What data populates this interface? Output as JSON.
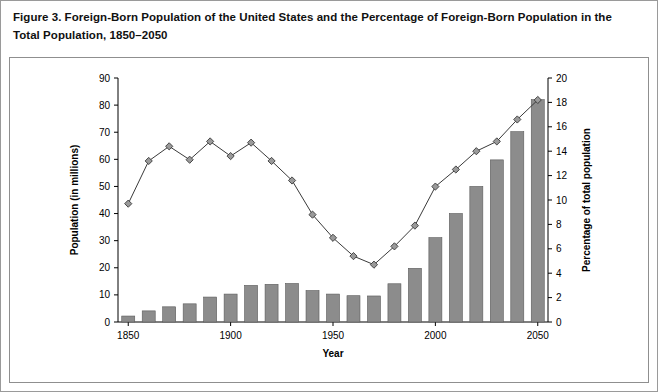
{
  "figure": {
    "title": "Figure 3. Foreign-Born Population of the United States and the Percentage of Foreign-Born Population in the Total Population, 1850–2050"
  },
  "chart_data": {
    "type": "bar",
    "title": "Figure 3. Foreign-Born Population of the United States and the Percentage of Foreign-Born Population in the Total Population, 1850–2050",
    "xlabel": "Year",
    "ylabel": "Population (in millions)",
    "y2label": "Percentage of total population",
    "xlim": [
      1845,
      2055
    ],
    "ylim": [
      0,
      90
    ],
    "y2lim": [
      0,
      20
    ],
    "grid": false,
    "legend": "none",
    "x_ticks": [
      1850,
      1900,
      1950,
      2000,
      2050
    ],
    "y_ticks": [
      0,
      10,
      20,
      30,
      40,
      50,
      60,
      70,
      80,
      90
    ],
    "y2_ticks": [
      0,
      2,
      4,
      6,
      8,
      10,
      12,
      14,
      16,
      18,
      20
    ],
    "categories": [
      1850,
      1860,
      1870,
      1880,
      1890,
      1900,
      1910,
      1920,
      1930,
      1940,
      1950,
      1960,
      1970,
      1980,
      1990,
      2000,
      2010,
      2020,
      2030,
      2040,
      2050
    ],
    "series": [
      {
        "name": "Population (in millions)",
        "type": "bar",
        "axis": "left",
        "values": [
          2.2,
          4.1,
          5.6,
          6.7,
          9.2,
          10.3,
          13.5,
          13.9,
          14.2,
          11.6,
          10.3,
          9.7,
          9.6,
          14.1,
          19.8,
          31.1,
          40.0,
          50.0,
          59.8,
          70.2,
          82.0
        ]
      },
      {
        "name": "Percentage of total population",
        "type": "line",
        "axis": "right",
        "values": [
          9.7,
          13.2,
          14.4,
          13.3,
          14.8,
          13.6,
          14.7,
          13.2,
          11.6,
          8.8,
          6.9,
          5.4,
          4.7,
          6.2,
          7.9,
          11.1,
          12.5,
          14.0,
          14.8,
          16.6,
          18.2
        ]
      }
    ]
  }
}
